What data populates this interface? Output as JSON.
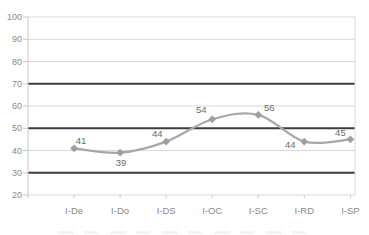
{
  "chart_data": {
    "type": "line",
    "title": "",
    "xlabel": "",
    "ylabel": "",
    "categories": [
      "I-De",
      "I-Do",
      "I-DS",
      "I-OC",
      "I-SC",
      "I-RD",
      "I-SP"
    ],
    "values": [
      41,
      39,
      44,
      54,
      56,
      44,
      45
    ],
    "ylim": [
      20,
      100
    ],
    "yticks": [
      20,
      30,
      40,
      50,
      60,
      70,
      80,
      90,
      100
    ],
    "emphasized_gridlines": [
      30,
      50,
      70
    ],
    "grid": true,
    "legend_position": "none",
    "marker": "diamond",
    "smooth": true,
    "data_labels": [
      {
        "text": "41",
        "dx": 7,
        "dy": -4
      },
      {
        "text": "39",
        "dx": 1,
        "dy": 13
      },
      {
        "text": "44",
        "dx": -9,
        "dy": -5
      },
      {
        "text": "54",
        "dx": -11,
        "dy": -6
      },
      {
        "text": "56",
        "dx": 11,
        "dy": -4
      },
      {
        "text": "44",
        "dx": -14,
        "dy": 6
      },
      {
        "text": "45",
        "dx": -10,
        "dy": -3
      }
    ],
    "colors": {
      "series_line": "#a8a8a8",
      "marker_fill": "#9e9e9e",
      "data_label_text": "#6b6b6b",
      "grid_minor": "#d9d9d9",
      "grid_emphasis": "#3d3d3d",
      "axis_line": "#c9c9c9",
      "axis_text": "#8a8a8a",
      "background": "#ffffff"
    }
  }
}
